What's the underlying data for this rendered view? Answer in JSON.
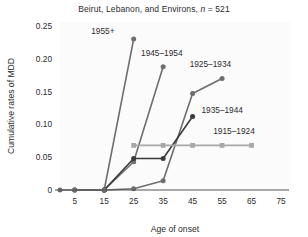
{
  "chart_data": {
    "type": "line",
    "title": "Beirut, Lebanon, and Environs, n = 521",
    "title_plain": "Beirut, Lebanon, and Environs,",
    "title_italic_n": "n",
    "title_n_value": "= 521",
    "xlabel": "Age of onset",
    "ylabel": "Cumulative rates of MDD",
    "xlim": [
      0,
      75
    ],
    "ylim": [
      0,
      0.25
    ],
    "xticks": [
      5,
      15,
      25,
      35,
      45,
      55,
      65,
      75
    ],
    "xtick_labels": [
      "5",
      "15",
      "25",
      "35",
      "45",
      "55",
      "65",
      "75"
    ],
    "yticks": [
      0,
      0.05,
      0.1,
      0.15,
      0.2,
      0.25
    ],
    "ytick_labels": [
      "0",
      "0.05",
      "0.10",
      "0.15",
      "0.20",
      "0.25"
    ],
    "grid": false,
    "legend_position": "inline-annotations",
    "series": [
      {
        "name": "1955+",
        "label": "1955+",
        "color": "#6e6e6e",
        "marker": "circle",
        "x": [
          5,
          15,
          25
        ],
        "values": [
          0,
          0,
          0.23
        ]
      },
      {
        "name": "1945-1954",
        "label": "1945–1954",
        "color": "#6e6e6e",
        "marker": "circle",
        "x": [
          5,
          15,
          25,
          35
        ],
        "values": [
          0,
          0,
          0.043,
          0.188
        ]
      },
      {
        "name": "1925-1934",
        "label": "1925–1934",
        "color": "#6e6e6e",
        "marker": "circle",
        "x": [
          15,
          25,
          35,
          45,
          55
        ],
        "values": [
          0,
          0.002,
          0.014,
          0.147,
          0.17
        ]
      },
      {
        "name": "1935-1944",
        "label": "1935–1944",
        "color": "#3a3a3a",
        "marker": "circle",
        "x": [
          15,
          25,
          35,
          45
        ],
        "values": [
          0,
          0.048,
          0.048,
          0.112
        ]
      },
      {
        "name": "1915-1924",
        "label": "1915–1924",
        "color": "#a8a8a8",
        "marker": "square",
        "x": [
          25,
          35,
          45,
          55,
          65
        ],
        "values": [
          0.068,
          0.068,
          0.068,
          0.068,
          0.068
        ]
      },
      {
        "name": "baseline-origin",
        "label": "",
        "color": "#6e6e6e",
        "marker": "circle",
        "x": [
          0,
          5,
          15
        ],
        "values": [
          0,
          0,
          0
        ]
      }
    ],
    "annotations": [
      {
        "text": "1955+",
        "x": 18.5,
        "y": 0.238,
        "anchor": "end"
      },
      {
        "text": "1945–1954",
        "x": 27.5,
        "y": 0.205,
        "anchor": "start"
      },
      {
        "text": "1925–1934",
        "x": 44.0,
        "y": 0.187,
        "anchor": "start"
      },
      {
        "text": "1935–1944",
        "x": 48.0,
        "y": 0.118,
        "anchor": "start"
      },
      {
        "text": "1915–1924",
        "x": 52.0,
        "y": 0.086,
        "anchor": "start"
      }
    ]
  }
}
